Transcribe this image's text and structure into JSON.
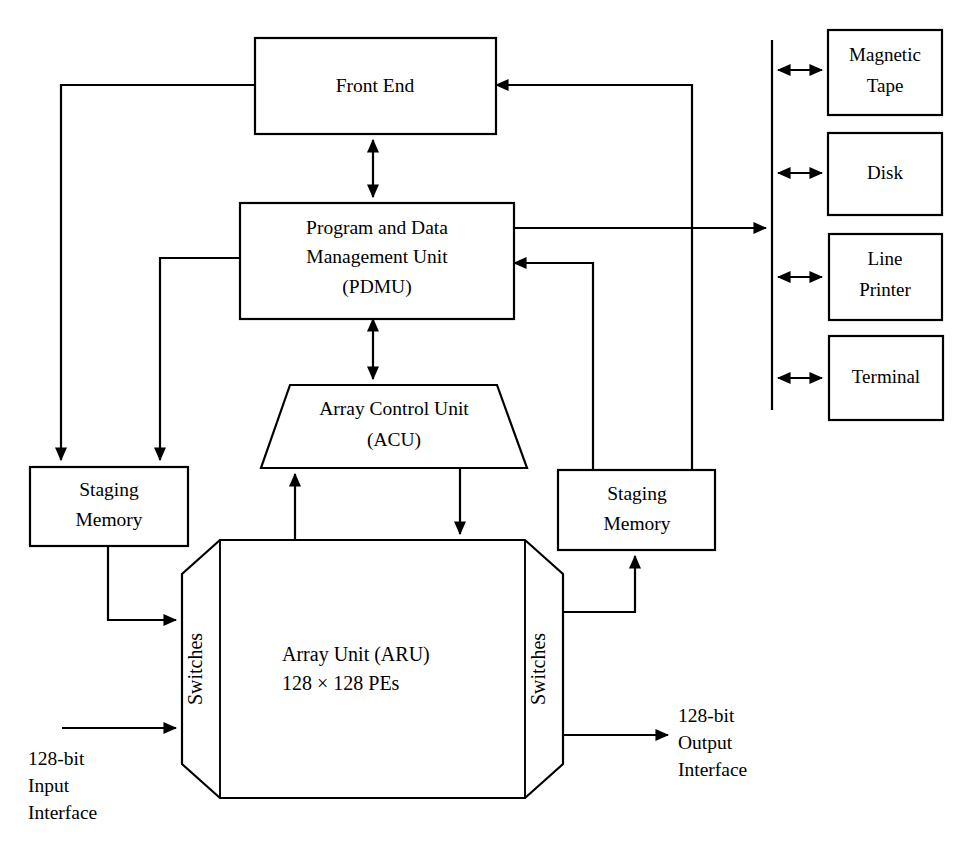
{
  "diagram": {
    "stroke_color": "#000000",
    "background_color": "#ffffff",
    "nodes": {
      "front_end": {
        "label": "Front End"
      },
      "pdmu": {
        "line1": "Program and Data",
        "line2": "Management Unit",
        "line3": "(PDMU)"
      },
      "acu": {
        "line1": "Array Control Unit",
        "line2": "(ACU)"
      },
      "aru": {
        "line1": "Array Unit (ARU)",
        "line2": "128 × 128 PEs"
      },
      "staging_memory_left": {
        "line1": "Staging",
        "line2": "Memory"
      },
      "staging_memory_right": {
        "line1": "Staging",
        "line2": "Memory"
      },
      "switches_left": {
        "label": "Switches"
      },
      "switches_right": {
        "label": "Switches"
      }
    },
    "peripherals": [
      {
        "line1": "Magnetic",
        "line2": "Tape"
      },
      {
        "line1": "Disk",
        "line2": ""
      },
      {
        "line1": "Line",
        "line2": "Printer"
      },
      {
        "line1": "Terminal",
        "line2": ""
      }
    ],
    "interfaces": {
      "input": {
        "line1": "128-bit",
        "line2": "Input",
        "line3": "Interface"
      },
      "output": {
        "line1": "128-bit",
        "line2": "Output",
        "line3": "Interface"
      }
    }
  }
}
